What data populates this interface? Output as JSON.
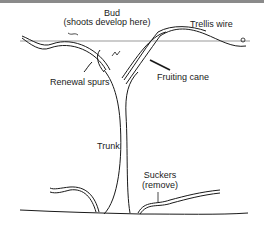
{
  "diagram": {
    "type": "labeled illustration",
    "labels": {
      "bud_line1": "Bud",
      "bud_line2": "(shoots develop here)",
      "trellis_wire": "Trellis wire",
      "renewal_spurs": "Renewal spurs",
      "fruiting_cane": "Fruiting cane",
      "trunk": "Trunk",
      "suckers_line1": "Suckers",
      "suckers_line2": "(remove)"
    },
    "colors": {
      "line": "#1a1a1a",
      "wire": "#9a9a9a",
      "background": "#ffffff",
      "top_strip": "#8a8a8a"
    }
  }
}
